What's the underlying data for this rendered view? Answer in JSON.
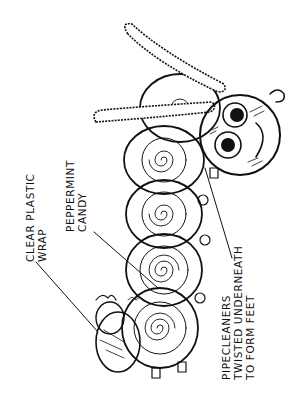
{
  "diagram": {
    "labels": {
      "clear_plastic_wrap": {
        "line1": "CLEAR PLASTIC",
        "line2": "WRAP"
      },
      "peppermint_candy": {
        "line1": "PEPPERMINT",
        "line2": "CANDY"
      },
      "pipe_cleaners": {
        "line1": "PIPECLEANERS",
        "line2": "TWISTED UNDERNEATH",
        "line3": "TO FORM FEET"
      }
    },
    "parts": [
      "head",
      "eyes",
      "antennae",
      "candy-segments",
      "tail",
      "feet"
    ],
    "segment_count": 5,
    "colors": {
      "ink": "#111111",
      "background": "#ffffff"
    }
  }
}
